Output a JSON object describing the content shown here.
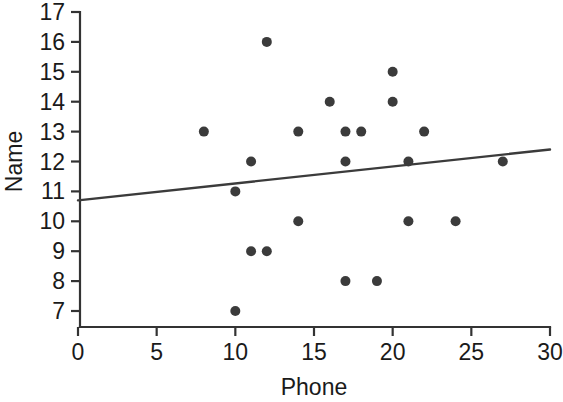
{
  "chart_data": {
    "type": "scatter",
    "title": "",
    "xlabel": "Phone",
    "ylabel": "Name",
    "xlim": [
      0,
      30
    ],
    "ylim": [
      7,
      17
    ],
    "xticks": [
      0,
      5,
      10,
      15,
      20,
      25,
      30
    ],
    "yticks": [
      7,
      8,
      9,
      10,
      11,
      12,
      13,
      14,
      15,
      16,
      17
    ],
    "xtick_labels": [
      "0",
      "5",
      "10",
      "15",
      "20",
      "25",
      "30"
    ],
    "ytick_labels": [
      "7",
      "8",
      "9",
      "10",
      "11",
      "12",
      "13",
      "14",
      "15",
      "16",
      "17"
    ],
    "grid": false,
    "legend": false,
    "legend_position": "none",
    "marker": "filled-circle",
    "marker_color": "#3b3b3b",
    "marker_size": 5,
    "points": [
      {
        "x": 8,
        "y": 13
      },
      {
        "x": 10,
        "y": 7
      },
      {
        "x": 10,
        "y": 11
      },
      {
        "x": 11,
        "y": 9
      },
      {
        "x": 11,
        "y": 12
      },
      {
        "x": 12,
        "y": 9
      },
      {
        "x": 12,
        "y": 16
      },
      {
        "x": 14,
        "y": 10
      },
      {
        "x": 14,
        "y": 13
      },
      {
        "x": 16,
        "y": 14
      },
      {
        "x": 17,
        "y": 8
      },
      {
        "x": 17,
        "y": 12
      },
      {
        "x": 17,
        "y": 13
      },
      {
        "x": 18,
        "y": 13
      },
      {
        "x": 19,
        "y": 8
      },
      {
        "x": 20,
        "y": 14
      },
      {
        "x": 20,
        "y": 15
      },
      {
        "x": 21,
        "y": 10
      },
      {
        "x": 21,
        "y": 12
      },
      {
        "x": 22,
        "y": 13
      },
      {
        "x": 24,
        "y": 10
      },
      {
        "x": 27,
        "y": 12
      }
    ],
    "trend_line": {
      "type": "linear-fit",
      "color": "#3b3b3b",
      "x_start": 0,
      "y_start": 10.7,
      "x_end": 30,
      "y_end": 12.4
    }
  }
}
